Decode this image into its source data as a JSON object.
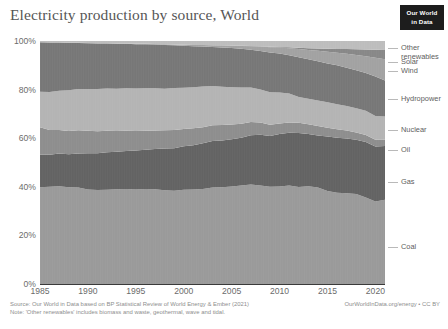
{
  "header": {
    "title": "Electricity production by source, World",
    "logo_line1": "Our World",
    "logo_line2": "in Data"
  },
  "footer": {
    "source_line": "Source: Our World in Data based on BP Statistical Review of World Energy & Ember (2021)",
    "note_line": "Note: 'Other renewables' includes biomass and waste, geothermal, wave and tidal.",
    "attribution": "OurWorldInData.org/energy • CC BY"
  },
  "axes": {
    "y_ticks": [
      "0%",
      "20%",
      "40%",
      "60%",
      "80%",
      "100%"
    ],
    "x_ticks": [
      "1985",
      "1990",
      "1995",
      "2000",
      "2005",
      "2010",
      "2015",
      "2020"
    ]
  },
  "chart_data": {
    "type": "area",
    "title": "Electricity production by source, World",
    "xlabel": "",
    "ylabel": "",
    "ylim": [
      0,
      100
    ],
    "xlim": [
      1985,
      2021
    ],
    "grid": false,
    "stacked": true,
    "normalized_percent": true,
    "legend_position": "right-outside",
    "x": [
      1985,
      1986,
      1987,
      1988,
      1989,
      1990,
      1991,
      1992,
      1993,
      1994,
      1995,
      1996,
      1997,
      1998,
      1999,
      2000,
      2001,
      2002,
      2003,
      2004,
      2005,
      2006,
      2007,
      2008,
      2009,
      2010,
      2011,
      2012,
      2013,
      2014,
      2015,
      2016,
      2017,
      2018,
      2019,
      2020,
      2021
    ],
    "series": [
      {
        "name": "Coal",
        "color": "#9a9a9a",
        "values": [
          38.2,
          38.4,
          38.8,
          38.6,
          38.7,
          38.1,
          38.0,
          38.1,
          38.4,
          38.6,
          38.7,
          38.9,
          38.7,
          38.4,
          38.2,
          38.6,
          38.7,
          39.0,
          39.7,
          40.1,
          40.5,
          41.0,
          41.6,
          41.1,
          40.4,
          40.6,
          41.2,
          40.6,
          41.1,
          40.5,
          39.0,
          38.2,
          38.2,
          38.0,
          36.6,
          35.1,
          36.0
        ],
        "label_y_pct": 14
      },
      {
        "name": "Gas",
        "color": "#636363",
        "values": [
          12.8,
          12.7,
          12.9,
          13.2,
          13.6,
          14.6,
          14.8,
          15.1,
          15.2,
          15.4,
          15.9,
          16.1,
          16.5,
          17.0,
          17.4,
          17.8,
          18.2,
          18.8,
          19.1,
          19.4,
          19.6,
          20.0,
          20.7,
          21.2,
          21.1,
          21.9,
          22.1,
          22.6,
          22.0,
          21.9,
          22.8,
          23.1,
          23.1,
          22.9,
          23.5,
          23.4,
          22.9
        ],
        "label_y_pct": 45
      },
      {
        "name": "Oil",
        "color": "#8e8e8e",
        "values": [
          10.9,
          9.8,
          9.4,
          9.2,
          9.3,
          9.0,
          8.9,
          8.7,
          8.4,
          8.2,
          8.0,
          7.8,
          7.6,
          7.5,
          7.4,
          7.1,
          6.9,
          6.6,
          6.5,
          6.4,
          6.1,
          5.8,
          5.5,
          5.1,
          4.7,
          4.4,
          4.3,
          4.3,
          4.2,
          4.0,
          3.7,
          3.5,
          3.3,
          3.1,
          2.9,
          2.8,
          2.7
        ],
        "label_y_pct": 61
      },
      {
        "name": "Nuclear",
        "color": "#b4b4b4",
        "values": [
          14.0,
          15.0,
          15.5,
          16.3,
          16.5,
          16.8,
          17.1,
          17.1,
          17.2,
          17.3,
          17.4,
          17.5,
          17.2,
          17.0,
          17.2,
          16.9,
          16.9,
          16.7,
          16.1,
          15.9,
          15.5,
          15.1,
          14.4,
          13.8,
          13.5,
          12.9,
          12.1,
          10.8,
          10.7,
          10.7,
          10.6,
          10.5,
          10.3,
          10.2,
          10.3,
          10.1,
          9.9
        ],
        "label_y_pct": 66
      },
      {
        "name": "Hydropower",
        "color": "#777777",
        "values": [
          19.5,
          19.5,
          19.1,
          18.9,
          18.5,
          18.5,
          18.4,
          18.2,
          18.2,
          18.0,
          18.1,
          18.0,
          17.9,
          17.9,
          17.5,
          17.2,
          16.8,
          16.5,
          16.1,
          16.3,
          16.2,
          16.1,
          15.8,
          16.1,
          16.5,
          16.2,
          16.0,
          16.6,
          16.6,
          16.5,
          16.3,
          16.3,
          16.1,
          16.0,
          16.0,
          16.8,
          15.3
        ],
        "label_y_pct": 82
      },
      {
        "name": "Wind",
        "color": "#a2a2a2",
        "values": [
          0.02,
          0.03,
          0.04,
          0.05,
          0.06,
          0.08,
          0.09,
          0.11,
          0.13,
          0.15,
          0.2,
          0.22,
          0.26,
          0.3,
          0.36,
          0.44,
          0.5,
          0.6,
          0.7,
          0.85,
          1.0,
          1.2,
          1.5,
          1.8,
          2.2,
          2.5,
          3.0,
          3.4,
          3.9,
          4.4,
          4.9,
          5.3,
          5.9,
          6.5,
          7.0,
          8.0,
          9.1
        ],
        "label_y_pct": 93.6
      },
      {
        "name": "Solar",
        "color": "#888888",
        "values": [
          0.0,
          0.0,
          0.0,
          0.0,
          0.0,
          0.0,
          0.0,
          0.0,
          0.0,
          0.01,
          0.01,
          0.01,
          0.01,
          0.01,
          0.02,
          0.02,
          0.02,
          0.03,
          0.03,
          0.04,
          0.05,
          0.07,
          0.1,
          0.13,
          0.2,
          0.25,
          0.4,
          0.6,
          0.8,
          1.0,
          1.3,
          1.6,
          2.0,
          2.4,
          2.9,
          3.4,
          4.0
        ],
        "label_y_pct": 96.4
      },
      {
        "name": "Other renewables",
        "color": "#bdbdbd",
        "values": [
          0.5,
          0.6,
          0.6,
          0.7,
          0.7,
          0.8,
          0.9,
          0.9,
          1.0,
          1.0,
          1.1,
          1.1,
          1.2,
          1.3,
          1.4,
          1.5,
          1.6,
          1.6,
          1.7,
          1.8,
          1.9,
          2.0,
          2.1,
          2.2,
          2.4,
          2.5,
          2.6,
          2.8,
          3.0,
          3.1,
          3.2,
          3.3,
          3.4,
          3.5,
          3.6,
          3.7,
          3.8
        ],
        "label_y_pct": 99
      }
    ]
  },
  "legend": [
    {
      "name": "Other renewables",
      "text_line1": "Other",
      "text_line2": "renewables",
      "top": 44
    },
    {
      "name": "Solar",
      "text_line1": "Solar",
      "text_line2": "",
      "top": 58
    },
    {
      "name": "Wind",
      "text_line1": "Wind",
      "text_line2": "",
      "top": 67
    },
    {
      "name": "Hydropower",
      "text_line1": "Hydropower",
      "text_line2": "",
      "top": 95
    },
    {
      "name": "Nuclear",
      "text_line1": "Nuclear",
      "text_line2": "",
      "top": 126
    },
    {
      "name": "Oil",
      "text_line1": "Oil",
      "text_line2": "",
      "top": 146
    },
    {
      "name": "Gas",
      "text_line1": "Gas",
      "text_line2": "",
      "top": 178
    },
    {
      "name": "Coal",
      "text_line1": "Coal",
      "text_line2": "",
      "top": 243
    }
  ]
}
